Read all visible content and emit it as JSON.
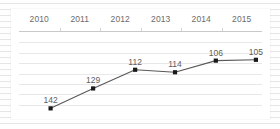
{
  "chart_data": {
    "type": "line",
    "title": "",
    "subtitle": "",
    "xlabel": "",
    "ylabel": "",
    "grid": true,
    "legend": false,
    "legend_position": "none",
    "categories": [
      "2010",
      "2011",
      "2012",
      "2013",
      "2014",
      "2015"
    ],
    "values": [
      142,
      129,
      112,
      114,
      106,
      105
    ],
    "data_labels": [
      "142",
      "129",
      "112",
      "114",
      "106",
      "105"
    ],
    "series": [
      {
        "name": "",
        "values": [
          142,
          129,
          112,
          114,
          106,
          105
        ],
        "line_color": "#595959",
        "marker_color": "#1a1a1a",
        "marker_shape": "square"
      }
    ],
    "ylim": [
      100,
      148
    ],
    "y_inverted": false,
    "gridline_count": 7,
    "axis_line_color": "#c9c9c9",
    "gridline_color": "#e8e8e8",
    "label_color": "#5e5e5e",
    "category_label_color": "#6b6b6b",
    "plot_background": "#ffffff",
    "page_background": "#f2f2f2"
  },
  "points": [
    {
      "category": "2010",
      "value": 142,
      "label": "142",
      "x_pct": 13.0,
      "y_pct": 92.0,
      "label_dy": -13
    },
    {
      "category": "2011",
      "value": 129,
      "label": "129",
      "x_pct": 30.5,
      "y_pct": 68.0,
      "label_dy": -13
    },
    {
      "category": "2012",
      "value": 112,
      "label": "112",
      "x_pct": 47.8,
      "y_pct": 45.5,
      "label_dy": -13
    },
    {
      "category": "2013",
      "value": 114,
      "label": "114",
      "x_pct": 64.2,
      "y_pct": 48.5,
      "label_dy": -13
    },
    {
      "category": "2014",
      "value": 106,
      "label": "106",
      "x_pct": 81.0,
      "y_pct": 34.5,
      "label_dy": -13
    },
    {
      "category": "2015",
      "value": 105,
      "label": "105",
      "x_pct": 97.5,
      "y_pct": 33.5,
      "label_dy": -13
    }
  ]
}
